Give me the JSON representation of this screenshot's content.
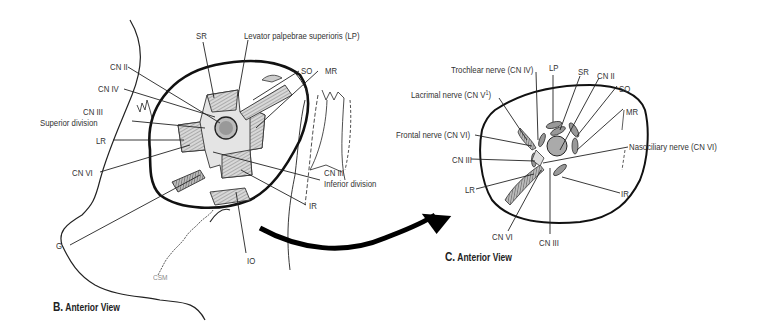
{
  "figure": {
    "panel_b": {
      "letter": "B.",
      "caption": "Anterior View",
      "labels": {
        "sr": "SR",
        "lp": "Levator palpebrae superioris (LP)",
        "cn2": "CN II",
        "cn4": "CN IV",
        "so": "SO",
        "mr": "MR",
        "cn3_sup_1": "CN III",
        "cn3_sup_2": "Superior division",
        "lr": "LR",
        "cn6": "CN VI",
        "cn3_inf_1": "CN III",
        "cn3_inf_2": "Inferior division",
        "ir": "IR",
        "g": "G",
        "io": "IO",
        "signature": "CSM"
      }
    },
    "panel_c": {
      "letter": "C.",
      "caption": "Anterior View",
      "labels": {
        "trochlear": "Trochlear nerve (CN IV)",
        "lp": "LP",
        "sr": "SR",
        "cn2": "CN II",
        "lacrimal": "Lacrimal nerve (CN V",
        "lacrimal_sup": "1",
        "lacrimal_end": ")",
        "so": "SO",
        "mr": "MR",
        "frontal": "Frontal nerve (CN VI)",
        "nasociliary": "Nasociliary nerve (CN VI)",
        "cn3": "CN III",
        "lr": "LR",
        "ir": "IR",
        "cn6": "CN VI",
        "cn3_bottom": "CN III"
      }
    },
    "arrow": {
      "direction": "panel B to panel C"
    }
  }
}
